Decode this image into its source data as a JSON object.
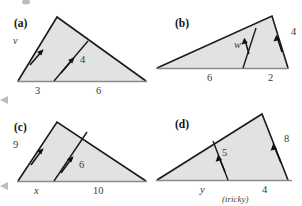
{
  "figure": {
    "kind": "geometry-diagram",
    "colors": {
      "triangle_fill": "#e2e2e2",
      "triangle_stroke": "#1a1a1a",
      "base_stroke": "#8a8a8a",
      "text": "#3a3a3a",
      "panel_label_text": "#111111",
      "background": "#ffffff"
    },
    "panels": [
      {
        "id": "a",
        "label": "(a)",
        "labels": [
          {
            "name": "left-side-label",
            "text": "v",
            "style": "italic"
          },
          {
            "name": "cevian-label",
            "text": "4",
            "style": "roman"
          },
          {
            "name": "base-left-label",
            "text": "3",
            "style": "roman"
          },
          {
            "name": "base-right-label",
            "text": "6",
            "style": "roman"
          }
        ]
      },
      {
        "id": "b",
        "label": "(b)",
        "labels": [
          {
            "name": "cevian-label",
            "text": "w",
            "style": "italic"
          },
          {
            "name": "right-side-label",
            "text": "4",
            "style": "roman"
          },
          {
            "name": "base-left-label",
            "text": "6",
            "style": "roman"
          },
          {
            "name": "base-right-label",
            "text": "2",
            "style": "roman"
          }
        ]
      },
      {
        "id": "c",
        "label": "(c)",
        "labels": [
          {
            "name": "left-side-label",
            "text": "9",
            "style": "roman"
          },
          {
            "name": "cevian-label",
            "text": "6",
            "style": "roman"
          },
          {
            "name": "base-left-label",
            "text": "x",
            "style": "italic"
          },
          {
            "name": "base-right-label",
            "text": "10",
            "style": "roman"
          }
        ]
      },
      {
        "id": "d",
        "label": "(d)",
        "labels": [
          {
            "name": "right-side-label",
            "text": "8",
            "style": "roman"
          },
          {
            "name": "cevian-label",
            "text": "5",
            "style": "roman"
          },
          {
            "name": "base-left-label",
            "text": "y",
            "style": "italic"
          },
          {
            "name": "base-right-label",
            "text": "4",
            "style": "roman"
          },
          {
            "name": "tricky-note",
            "text": "(tricky)",
            "style": "italic"
          }
        ]
      }
    ]
  }
}
